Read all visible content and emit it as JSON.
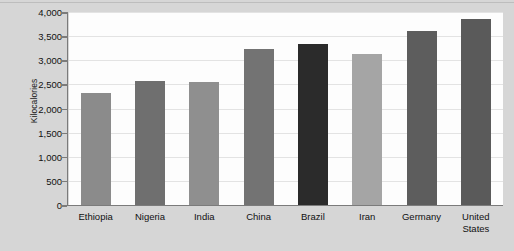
{
  "chart_data": {
    "type": "bar",
    "title": "",
    "subtitle": "",
    "xlabel": "",
    "ylabel": "Kilocalories",
    "ylim": [
      0,
      4000
    ],
    "ytick_step": 500,
    "grid": true,
    "legend": false,
    "legend_position": "none",
    "categories": [
      "Ethiopia",
      "Nigeria",
      "India",
      "China",
      "Brazil",
      "Iran",
      "Germany",
      "United States"
    ],
    "values": [
      2330,
      2570,
      2540,
      3230,
      3330,
      3140,
      3600,
      3850
    ],
    "ytick_labels": [
      "0",
      "500",
      "1,000",
      "1,500",
      "2,000",
      "2,500",
      "3,000",
      "3,500",
      "4,000"
    ],
    "ytick_values": [
      0,
      500,
      1000,
      1500,
      2000,
      2500,
      3000,
      3500,
      4000
    ],
    "bar_colors": [
      "#8b8b8b",
      "#6f6f6f",
      "#8f8f8f",
      "#737373",
      "#2b2b2b",
      "#a5a5a5",
      "#5d5d5d",
      "#5a5a5a"
    ],
    "xtick_lines": [
      [
        "Ethiopia"
      ],
      [
        "Nigeria"
      ],
      [
        "India"
      ],
      [
        "China"
      ],
      [
        "Brazil"
      ],
      [
        "Iran"
      ],
      [
        "Germany"
      ],
      [
        "United",
        "States"
      ]
    ]
  },
  "figure": {
    "background_color": "#d6d6d6",
    "plot_background_color": "#fdfdfd",
    "gridline_color": "#e3e3e3",
    "axis_color": "#7b7b7b",
    "text_color": "#111111"
  }
}
